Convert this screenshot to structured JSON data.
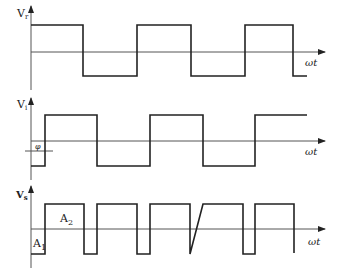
{
  "diagram": {
    "panels": [
      {
        "id": "vr",
        "y_label": "V",
        "y_sub": "r",
        "x_label": "ωt",
        "description": "square wave reference",
        "annotations": []
      },
      {
        "id": "vi",
        "y_label": "V",
        "y_sub": "i",
        "x_label": "ωt",
        "description": "square wave phase-shifted by φ",
        "annotations": [
          {
            "text": "φ",
            "meaning": "phase shift"
          }
        ]
      },
      {
        "id": "vs",
        "y_label": "V",
        "y_sub": "s",
        "x_label": "ωt",
        "description": "product pulse waveform",
        "annotations": [
          {
            "text": "A",
            "sub": "1"
          },
          {
            "text": "A",
            "sub": "2"
          }
        ]
      }
    ]
  },
  "colors": {
    "line": "#222222",
    "axis": "#555555",
    "background": "#ffffff"
  }
}
